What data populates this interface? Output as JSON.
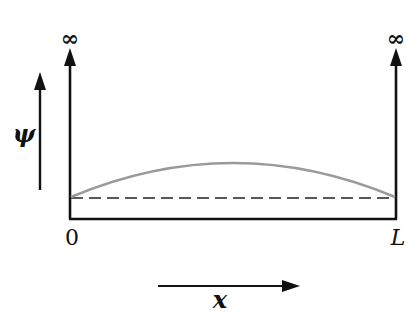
{
  "diagram": {
    "labels": {
      "left_wall_top": "∞",
      "right_wall_top": "∞",
      "y_axis": "ψ",
      "x_axis": "x",
      "left_boundary": "0",
      "right_boundary": "L"
    },
    "colors": {
      "lines": "#111111",
      "wavefunction": "#9a9a9a",
      "background": "#ffffff"
    },
    "elements": {
      "walls": "two vertical walls with upward arrows extending to infinity",
      "floor": "solid bottom of well from 0 to L",
      "baseline": "dashed horizontal reference line",
      "curve": "half-sine arch spanning 0 to L above dashed baseline"
    }
  }
}
